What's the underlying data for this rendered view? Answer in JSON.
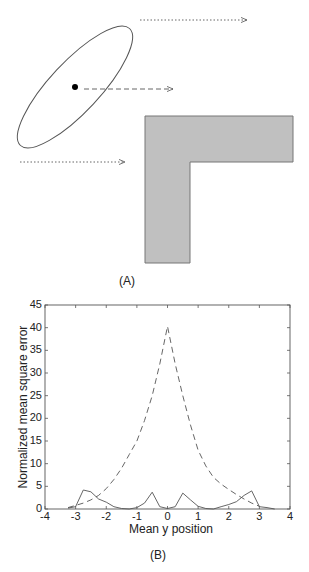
{
  "panel_a": {
    "label": "(A)",
    "shapes": {
      "ellipse": {
        "cx": 75,
        "cy": 87,
        "rx": 80,
        "ry": 25,
        "rotation_deg": -47,
        "stroke": "#555555"
      },
      "center_dot": {
        "cx": 75,
        "cy": 87,
        "r": 3
      },
      "arrows": [
        {
          "style": "dotted",
          "x1": 140,
          "y1": 20,
          "x2": 247,
          "y2": 20
        },
        {
          "style": "dashed",
          "x1": 84,
          "y1": 89,
          "x2": 173,
          "y2": 89
        },
        {
          "style": "dotted",
          "x1": 20,
          "y1": 162,
          "x2": 125,
          "y2": 162
        }
      ],
      "l_shape": {
        "fill": "#c0c0c0",
        "stroke": "#777777",
        "points": "145,116 293,116 293,162 190,162 190,263 145,263"
      }
    }
  },
  "panel_b": {
    "label": "(B)"
  },
  "chart_data": {
    "type": "line",
    "title": "",
    "xlabel": "Mean y position",
    "ylabel": "Normalized mean square error",
    "xlim": [
      -4,
      4
    ],
    "ylim": [
      0,
      45
    ],
    "xticks": [
      -4,
      -3,
      -2,
      -1,
      0,
      1,
      2,
      3,
      4
    ],
    "yticks": [
      0,
      5,
      10,
      15,
      20,
      25,
      30,
      35,
      40,
      45
    ],
    "grid": false,
    "legend": null,
    "series": [
      {
        "name": "dashed",
        "style": "dashed",
        "x": [
          -3.25,
          -3.0,
          -2.75,
          -2.5,
          -2.25,
          -2.0,
          -1.75,
          -1.5,
          -1.25,
          -1.0,
          -0.75,
          -0.5,
          -0.25,
          0.0,
          0.25,
          0.5,
          0.75,
          1.0,
          1.25,
          1.5,
          1.75,
          2.0,
          2.25,
          2.5,
          2.75,
          3.0
        ],
        "y": [
          0.3,
          0.8,
          1.3,
          2.0,
          3.0,
          4.5,
          6.5,
          9.0,
          12.0,
          15.0,
          19.5,
          25.0,
          32.0,
          40.3,
          32.0,
          25.0,
          18.5,
          13.0,
          9.5,
          7.0,
          5.5,
          4.3,
          3.2,
          2.2,
          1.3,
          0.6
        ]
      },
      {
        "name": "solid",
        "style": "solid",
        "x": [
          -3.25,
          -3.0,
          -2.75,
          -2.5,
          -2.25,
          -2.0,
          -1.75,
          -1.5,
          -1.25,
          -1.0,
          -0.75,
          -0.5,
          -0.25,
          0.0,
          0.25,
          0.5,
          0.75,
          1.0,
          1.25,
          1.5,
          1.75,
          2.0,
          2.25,
          2.5,
          2.75,
          3.0,
          3.25,
          3.5
        ],
        "y": [
          0.2,
          0.5,
          4.2,
          3.8,
          2.2,
          1.5,
          0.5,
          0.1,
          0.0,
          0.3,
          1.3,
          3.7,
          0.5,
          0.1,
          0.5,
          3.5,
          2.0,
          0.6,
          0.1,
          0.0,
          0.5,
          1.0,
          1.6,
          3.0,
          4.0,
          0.5,
          0.3,
          0.0
        ]
      }
    ]
  }
}
